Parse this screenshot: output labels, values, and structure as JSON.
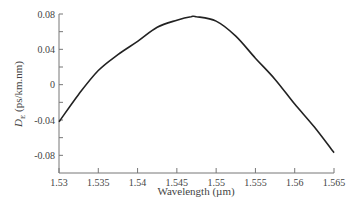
{
  "chart_data": {
    "type": "line",
    "title": "",
    "xlabel": "Wavelength (µm)",
    "ylabel": "D_E (ps/km.nm)",
    "ylabel_main": "D",
    "ylabel_sub": "E",
    "ylabel_rest": " (ps/km.nm)",
    "xlim": [
      1.53,
      1.565
    ],
    "ylim": [
      -0.1,
      0.08
    ],
    "x_ticks": [
      1.53,
      1.535,
      1.54,
      1.545,
      1.55,
      1.555,
      1.56,
      1.565
    ],
    "x_tick_labels": [
      "1.53",
      "1.535",
      "1.54",
      "1.545",
      "1.55",
      "1.555",
      "1.56",
      "1.565"
    ],
    "y_ticks_major": [
      0.08,
      0.04,
      0,
      -0.04,
      -0.08
    ],
    "y_tick_labels": [
      "0.08",
      "0.04",
      "0",
      "-0.04",
      "-0.08"
    ],
    "y_ticks_minor": [
      0.06,
      0.02,
      -0.02,
      -0.06
    ],
    "grid": false,
    "legend": null,
    "series": [
      {
        "name": "D_E",
        "x": [
          1.53,
          1.5325,
          1.535,
          1.5375,
          1.54,
          1.5425,
          1.545,
          1.5468,
          1.5475,
          1.55,
          1.5525,
          1.555,
          1.5575,
          1.56,
          1.5625,
          1.565
        ],
        "y": [
          -0.042,
          -0.011,
          0.016,
          0.034,
          0.049,
          0.065,
          0.073,
          0.077,
          0.077,
          0.072,
          0.055,
          0.03,
          0.006,
          -0.022,
          -0.048,
          -0.077
        ]
      }
    ]
  }
}
